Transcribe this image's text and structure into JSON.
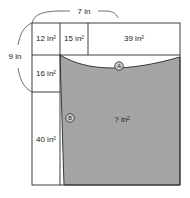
{
  "figure": {
    "dimensions": [
      {
        "name": "top-width",
        "label": "7 in",
        "orientation": "horizontal"
      },
      {
        "name": "left-height",
        "label": "9 in",
        "orientation": "vertical"
      }
    ],
    "cells": [
      {
        "name": "cell-12",
        "label": "12 in²",
        "shaded": false
      },
      {
        "name": "cell-15",
        "label": "15 in²",
        "shaded": false
      },
      {
        "name": "cell-39",
        "label": "39 in²",
        "shaded": false
      },
      {
        "name": "cell-16",
        "label": "16 in²",
        "shaded": false
      },
      {
        "name": "cell-40",
        "label": "40 in²",
        "shaded": false
      },
      {
        "name": "cell-unknown",
        "label": "? in²",
        "shaded": true
      }
    ],
    "markers": [
      {
        "name": "marker-a",
        "label": "A"
      },
      {
        "name": "marker-b",
        "label": "B"
      }
    ],
    "colors": {
      "shaded_fill": "#a8a8a8",
      "outline": "#2b2b2b",
      "background": "#ffffff",
      "marker_fill": "#c9c9c9"
    }
  }
}
